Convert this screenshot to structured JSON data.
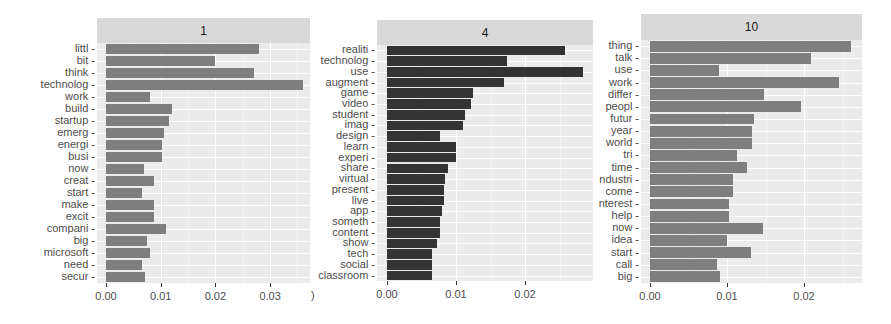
{
  "chart_data": {
    "type": "bar",
    "orientation": "horizontal",
    "layout": "facet_wrap",
    "grid": true,
    "legend": "none",
    "panels": [
      {
        "strip_label": "1",
        "bar_color": "#7f7f7f",
        "xlim": [
          0,
          0.037
        ],
        "x_ticks": [
          "0.00",
          "0.01",
          "0.02",
          "0.03"
        ],
        "categories": [
          "littl",
          "bit",
          "think",
          "technolog",
          "work",
          "build",
          "startup",
          "emerg",
          "energi",
          "busi",
          "now",
          "creat",
          "start",
          "make",
          "excit",
          "compani",
          "big",
          "microsoft",
          "need",
          "secur"
        ],
        "values": [
          0.028,
          0.02,
          0.027,
          0.036,
          0.008,
          0.012,
          0.0115,
          0.0106,
          0.0102,
          0.0102,
          0.0069,
          0.0088,
          0.0066,
          0.0088,
          0.0088,
          0.011,
          0.0075,
          0.008,
          0.0066,
          0.0071
        ]
      },
      {
        "strip_label": "4",
        "bar_color": "#333333",
        "xlim": [
          0,
          0.03
        ],
        "x_ticks": [
          "0.00",
          "0.01",
          "0.02"
        ],
        "categories": [
          "realiti",
          "technolog",
          "use",
          "augment",
          "game",
          "video",
          "student",
          "imag",
          "design",
          "learn",
          "experi",
          "share",
          "virtual",
          "present",
          "live",
          "app",
          "someth",
          "content",
          "show",
          "tech",
          "social",
          "classroom"
        ],
        "values": [
          0.0258,
          0.0174,
          0.0284,
          0.017,
          0.0125,
          0.0122,
          0.0113,
          0.011,
          0.0077,
          0.01,
          0.01,
          0.0088,
          0.0084,
          0.0083,
          0.0083,
          0.008,
          0.0077,
          0.0077,
          0.0072,
          0.0065,
          0.0065,
          0.0065
        ]
      },
      {
        "strip_label": "10",
        "bar_color": "#7f7f7f",
        "xlim": [
          0,
          0.027
        ],
        "x_ticks": [
          "0.00",
          "0.01",
          "0.02"
        ],
        "categories": [
          "thing",
          "talk",
          "use",
          "work",
          "differ",
          "peopl",
          "futur",
          "year",
          "world",
          "tri",
          "time",
          "ndustri",
          "come",
          "nterest",
          "help",
          "now",
          "idea",
          "start",
          "call",
          "big"
        ],
        "values": [
          0.0261,
          0.0209,
          0.009,
          0.0245,
          0.0148,
          0.0196,
          0.0135,
          0.0132,
          0.0132,
          0.0113,
          0.0126,
          0.0108,
          0.0108,
          0.0103,
          0.0103,
          0.0147,
          0.01,
          0.0131,
          0.0087,
          0.0091
        ]
      }
    ],
    "title": "",
    "xlabel": "",
    "ylabel": ""
  },
  "stray_glyph": ")"
}
